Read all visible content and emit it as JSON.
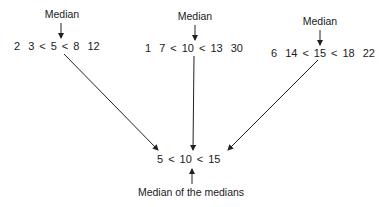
{
  "groups": [
    {
      "label": "Median",
      "values": [
        "2",
        "3",
        "5",
        "8",
        "12"
      ],
      "median": "5"
    },
    {
      "label": "Median",
      "values": [
        "1",
        "7",
        "10",
        "13",
        "30"
      ],
      "median": "10"
    },
    {
      "label": "Median",
      "values": [
        "6",
        "14",
        "15",
        "18",
        "22"
      ],
      "median": "15"
    }
  ],
  "result": {
    "values": [
      "5",
      "10",
      "15"
    ],
    "operator": "<",
    "label": "Median of the medians"
  },
  "operator": "<",
  "colors": {
    "text": "#1a1a1a",
    "arrow": "#222222",
    "background": "#ffffff"
  }
}
